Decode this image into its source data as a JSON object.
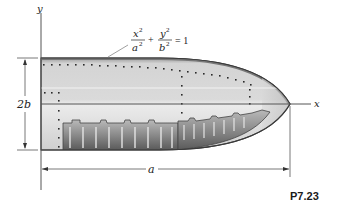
{
  "figure": {
    "problem_label": "P7.23",
    "axes": {
      "x_label": "x",
      "y_label": "y"
    },
    "dimensions": {
      "height_label": "2b",
      "length_label": "a"
    },
    "equation": {
      "term1_num": "x",
      "term1_num_exp": "2",
      "term1_den": "a",
      "term1_den_exp": "2",
      "plus": "+",
      "term2_num": "y",
      "term2_num_exp": "2",
      "term2_den": "b",
      "term2_den_exp": "2",
      "equals": "= 1"
    },
    "colors": {
      "axis_line": "#555555",
      "outline": "#3a3a3a",
      "shell_light": "#e2e2e2",
      "shell_mid": "#c9c9c9",
      "inner_dark": "#6e6e6e",
      "rivet": "#2a2a2a",
      "background": "#ffffff"
    }
  }
}
